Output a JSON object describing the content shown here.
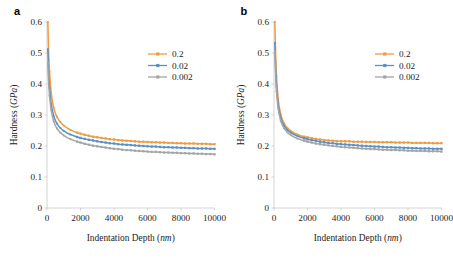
{
  "figure": {
    "background": "#ffffff",
    "panels": [
      {
        "label": "a",
        "name": "panel-a"
      },
      {
        "label": "b",
        "name": "panel-b"
      }
    ]
  },
  "axes": {
    "xlabel_main": "Indentation Depth (",
    "xlabel_unit": "nm",
    "xlabel_close": ")",
    "ylabel_main": "Hardness (",
    "ylabel_unit": "GPa",
    "ylabel_close": ")",
    "xticks": [
      "0",
      "2000",
      "4000",
      "6000",
      "8000",
      "10000"
    ],
    "yticks": [
      "0",
      "0.1",
      "0.2",
      "0.3",
      "0.4",
      "0.5",
      "0.6"
    ],
    "xlim": [
      0,
      10000
    ],
    "ylim": [
      0,
      0.6
    ],
    "grid": false
  },
  "legend": {
    "position": "upper-right",
    "entries": [
      {
        "label": "0.2",
        "color": "#ED9C44"
      },
      {
        "label": "0.02",
        "color": "#5B8FC9"
      },
      {
        "label": "0.002",
        "color": "#A5A5A5"
      }
    ]
  },
  "colors": {
    "series_0_2": "#ED9C44",
    "series_0_02": "#5B8FC9",
    "series_0_002": "#A5A5A5",
    "axis": "#c9c9c9",
    "text": "#1d1d1d"
  },
  "chart_data": [
    {
      "type": "line",
      "panel": "a",
      "title": "a",
      "xlabel": "Indentation Depth (nm)",
      "ylabel": "Hardness (GPa)",
      "xlim": [
        0,
        10000
      ],
      "ylim": [
        0,
        0.6
      ],
      "grid": false,
      "legend": "upper right",
      "x": [
        50,
        100,
        150,
        200,
        250,
        300,
        400,
        500,
        600,
        700,
        800,
        900,
        1000,
        1200,
        1400,
        1600,
        1800,
        2000,
        2250,
        2500,
        2750,
        3000,
        3250,
        3500,
        3750,
        4000,
        4250,
        4500,
        4750,
        5000,
        5250,
        5500,
        5750,
        6000,
        6250,
        6500,
        6750,
        7000,
        7250,
        7500,
        7750,
        8000,
        8250,
        8500,
        8750,
        9000,
        9250,
        9500,
        9750,
        10000
      ],
      "series": [
        {
          "name": "0.2",
          "color": "#ED9C44",
          "marker": "square",
          "values": [
            0.6,
            0.497,
            0.44,
            0.4,
            0.372,
            0.352,
            0.323,
            0.305,
            0.293,
            0.284,
            0.277,
            0.271,
            0.266,
            0.258,
            0.252,
            0.247,
            0.243,
            0.24,
            0.236,
            0.233,
            0.23,
            0.228,
            0.226,
            0.224,
            0.222,
            0.221,
            0.219,
            0.218,
            0.217,
            0.216,
            0.215,
            0.214,
            0.214,
            0.213,
            0.212,
            0.212,
            0.211,
            0.211,
            0.21,
            0.21,
            0.209,
            0.209,
            0.208,
            0.208,
            0.208,
            0.207,
            0.207,
            0.207,
            0.206,
            0.206
          ]
        },
        {
          "name": "0.02",
          "color": "#5B8FC9",
          "marker": "square",
          "values": [
            0.512,
            0.432,
            0.388,
            0.358,
            0.336,
            0.32,
            0.297,
            0.282,
            0.272,
            0.264,
            0.258,
            0.253,
            0.249,
            0.242,
            0.237,
            0.233,
            0.229,
            0.226,
            0.223,
            0.22,
            0.218,
            0.215,
            0.213,
            0.211,
            0.209,
            0.208,
            0.206,
            0.205,
            0.204,
            0.203,
            0.202,
            0.201,
            0.2,
            0.199,
            0.198,
            0.198,
            0.197,
            0.196,
            0.196,
            0.195,
            0.195,
            0.194,
            0.194,
            0.193,
            0.193,
            0.192,
            0.192,
            0.192,
            0.191,
            0.191
          ]
        },
        {
          "name": "0.002",
          "color": "#A5A5A5",
          "marker": "square",
          "values": [
            0.47,
            0.4,
            0.362,
            0.336,
            0.316,
            0.301,
            0.28,
            0.266,
            0.256,
            0.249,
            0.243,
            0.238,
            0.234,
            0.227,
            0.222,
            0.218,
            0.214,
            0.211,
            0.207,
            0.204,
            0.201,
            0.199,
            0.197,
            0.195,
            0.193,
            0.191,
            0.19,
            0.188,
            0.187,
            0.186,
            0.185,
            0.184,
            0.183,
            0.182,
            0.181,
            0.181,
            0.18,
            0.179,
            0.179,
            0.178,
            0.178,
            0.177,
            0.177,
            0.176,
            0.176,
            0.175,
            0.175,
            0.174,
            0.174,
            0.173
          ]
        }
      ]
    },
    {
      "type": "line",
      "panel": "b",
      "title": "b",
      "xlabel": "Indentation Depth (nm)",
      "ylabel": "Hardness (GPa)",
      "xlim": [
        0,
        10000
      ],
      "ylim": [
        0,
        0.6
      ],
      "grid": false,
      "legend": "upper right",
      "x": [
        50,
        100,
        150,
        200,
        250,
        300,
        400,
        500,
        600,
        700,
        800,
        900,
        1000,
        1200,
        1400,
        1600,
        1800,
        2000,
        2250,
        2500,
        2750,
        3000,
        3250,
        3500,
        3750,
        4000,
        4250,
        4500,
        4750,
        5000,
        5250,
        5500,
        5750,
        6000,
        6250,
        6500,
        6750,
        7000,
        7250,
        7500,
        7750,
        8000,
        8250,
        8500,
        8750,
        9000,
        9250,
        9500,
        9750,
        10000
      ],
      "series": [
        {
          "name": "0.2",
          "color": "#ED9C44",
          "marker": "square",
          "values": [
            0.6,
            0.492,
            0.425,
            0.382,
            0.352,
            0.331,
            0.302,
            0.285,
            0.273,
            0.265,
            0.258,
            0.253,
            0.249,
            0.242,
            0.237,
            0.233,
            0.23,
            0.228,
            0.225,
            0.223,
            0.221,
            0.219,
            0.218,
            0.217,
            0.216,
            0.215,
            0.215,
            0.215,
            0.214,
            0.214,
            0.214,
            0.213,
            0.213,
            0.213,
            0.212,
            0.212,
            0.212,
            0.212,
            0.211,
            0.211,
            0.211,
            0.211,
            0.21,
            0.21,
            0.21,
            0.21,
            0.21,
            0.209,
            0.209,
            0.209
          ]
        },
        {
          "name": "0.02",
          "color": "#5B8FC9",
          "marker": "square",
          "values": [
            0.533,
            0.444,
            0.392,
            0.358,
            0.333,
            0.315,
            0.291,
            0.276,
            0.266,
            0.258,
            0.252,
            0.247,
            0.243,
            0.237,
            0.232,
            0.228,
            0.225,
            0.222,
            0.219,
            0.217,
            0.214,
            0.212,
            0.21,
            0.209,
            0.207,
            0.206,
            0.205,
            0.204,
            0.203,
            0.202,
            0.201,
            0.2,
            0.199,
            0.198,
            0.198,
            0.197,
            0.196,
            0.196,
            0.195,
            0.195,
            0.194,
            0.194,
            0.193,
            0.193,
            0.192,
            0.192,
            0.192,
            0.191,
            0.191,
            0.191
          ]
        },
        {
          "name": "0.002",
          "color": "#A5A5A5",
          "marker": "square",
          "values": [
            0.505,
            0.424,
            0.376,
            0.344,
            0.321,
            0.304,
            0.281,
            0.267,
            0.257,
            0.25,
            0.244,
            0.239,
            0.235,
            0.229,
            0.224,
            0.22,
            0.217,
            0.214,
            0.211,
            0.208,
            0.206,
            0.204,
            0.202,
            0.2,
            0.199,
            0.197,
            0.196,
            0.195,
            0.194,
            0.193,
            0.192,
            0.191,
            0.19,
            0.19,
            0.189,
            0.188,
            0.188,
            0.187,
            0.187,
            0.186,
            0.186,
            0.185,
            0.185,
            0.184,
            0.184,
            0.184,
            0.183,
            0.183,
            0.183,
            0.182
          ]
        }
      ]
    }
  ]
}
